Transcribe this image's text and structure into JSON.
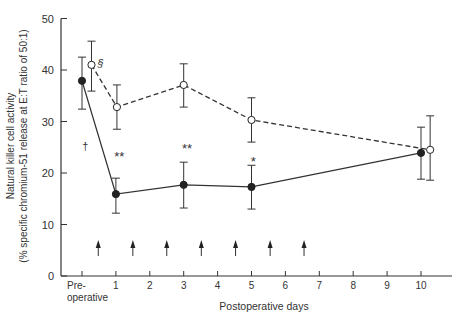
{
  "chart_data": {
    "type": "line",
    "title": "",
    "xlabel": "Postoperative days",
    "ylabel_line1": "Natural killer cell activity",
    "ylabel_line2": "(% specific chromium-51 release at E:T ratio of 50:1)",
    "ylim": [
      0,
      50
    ],
    "yticks": [
      0,
      10,
      20,
      30,
      40,
      50
    ],
    "xticks": [
      {
        "pos": 0,
        "label": "Pre-",
        "label2": "operative"
      },
      {
        "pos": 1,
        "label": "1"
      },
      {
        "pos": 2,
        "label": "2"
      },
      {
        "pos": 3,
        "label": "3"
      },
      {
        "pos": 4,
        "label": "4"
      },
      {
        "pos": 5,
        "label": "5"
      },
      {
        "pos": 6,
        "label": "6"
      },
      {
        "pos": 7,
        "label": "7"
      },
      {
        "pos": 8,
        "label": "8"
      },
      {
        "pos": 9,
        "label": "9"
      },
      {
        "pos": 10,
        "label": "10"
      }
    ],
    "grid": false,
    "series": [
      {
        "name": "filled-circles-solid",
        "style": "solid",
        "marker": "filled",
        "points": [
          {
            "x": 0,
            "y": 37.9,
            "lo": 32.4,
            "hi": 42.5
          },
          {
            "x": 1,
            "y": 15.9,
            "lo": 12.2,
            "hi": 19.0
          },
          {
            "x": 3,
            "y": 17.7,
            "lo": 13.2,
            "hi": 22.1
          },
          {
            "x": 5,
            "y": 17.3,
            "lo": 13.0,
            "hi": 21.5
          },
          {
            "x": 10,
            "y": 23.9,
            "lo": 18.8,
            "hi": 28.9
          }
        ]
      },
      {
        "name": "open-circles-dashed",
        "style": "dashed",
        "marker": "open",
        "points": [
          {
            "x": 0.28,
            "y": 41.0,
            "lo": 35.9,
            "hi": 45.6
          },
          {
            "x": 1.03,
            "y": 32.8,
            "lo": 28.5,
            "hi": 37.1
          },
          {
            "x": 3,
            "y": 37.1,
            "lo": 32.8,
            "hi": 41.2
          },
          {
            "x": 5,
            "y": 30.3,
            "lo": 26.0,
            "hi": 34.6
          },
          {
            "x": 10.27,
            "y": 24.5,
            "lo": 18.6,
            "hi": 31.1
          }
        ]
      }
    ],
    "annotations": [
      {
        "text": "§",
        "x": 0.55,
        "y": 40.5
      },
      {
        "text": "†",
        "x": 0.1,
        "y": 24.5
      },
      {
        "text": "**",
        "x": 1.1,
        "y": 22.3
      },
      {
        "text": "**",
        "x": 3.1,
        "y": 23.8
      },
      {
        "text": "*",
        "x": 5.05,
        "y": 21.3
      }
    ],
    "arrows_x": [
      0.48,
      1.5,
      2.5,
      3.52,
      4.53,
      5.55,
      6.55
    ]
  }
}
